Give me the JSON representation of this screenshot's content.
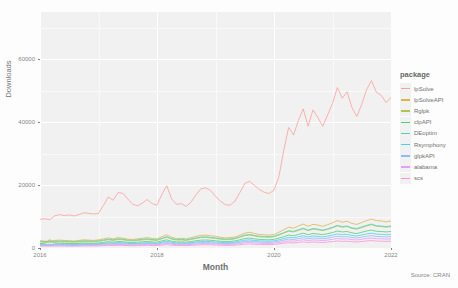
{
  "chart_data": {
    "type": "line",
    "title": "",
    "xlabel": "Month",
    "ylabel": "Downloads",
    "caption": "Source: CRAN",
    "legend_title": "package",
    "legend_position": "right",
    "grid": true,
    "xlim": [
      2016.0,
      2022.0
    ],
    "ylim": [
      0,
      75000
    ],
    "x_ticks": [
      "2016",
      "2018",
      "2020",
      "2022"
    ],
    "x_tick_values": [
      2016,
      2018,
      2020,
      2022
    ],
    "y_ticks": [
      "0",
      "20000",
      "40000",
      "60000"
    ],
    "y_tick_values": [
      0,
      20000,
      40000,
      60000
    ],
    "x_start": 2016.0,
    "x_step": 0.08333,
    "series": [
      {
        "name": "lpSolve",
        "color": "#F8766D",
        "values": [
          9100,
          9300,
          9000,
          10200,
          10600,
          10300,
          10500,
          10200,
          10600,
          11200,
          11000,
          10800,
          11000,
          13500,
          16200,
          15200,
          17600,
          17400,
          15600,
          13900,
          13400,
          14300,
          15400,
          14100,
          13600,
          17000,
          19800,
          15600,
          13900,
          14100,
          13200,
          14600,
          16900,
          18800,
          19100,
          18300,
          16400,
          14900,
          13800,
          13600,
          14900,
          17600,
          20500,
          21200,
          19900,
          18600,
          17700,
          17300,
          18400,
          22600,
          31000,
          38300,
          35900,
          40500,
          44200,
          38700,
          43900,
          41500,
          38700,
          42300,
          45900,
          51000,
          47600,
          49600,
          44600,
          41800,
          45700,
          50300,
          53200,
          49500,
          48500,
          46200,
          47900,
          50000,
          46300,
          43700,
          48200,
          49600,
          49100,
          46200,
          43200,
          43400,
          47000,
          52500,
          55900,
          63700,
          58200,
          70500,
          61800,
          61900,
          56900,
          53900,
          49100,
          53500,
          59000,
          65500
        ]
      },
      {
        "name": "lpSolveAPI",
        "color": "#D39200",
        "values": [
          2300,
          2200,
          2100,
          2400,
          2500,
          2400,
          2300,
          2200,
          2400,
          2600,
          2500,
          2400,
          2600,
          2900,
          3200,
          2900,
          3300,
          3100,
          2800,
          2700,
          2900,
          3100,
          3300,
          3000,
          2900,
          3600,
          4200,
          3400,
          3000,
          3100,
          2900,
          3300,
          3700,
          4000,
          4100,
          3900,
          3700,
          3400,
          3200,
          3300,
          3500,
          4100,
          4700,
          5000,
          4600,
          4300,
          4200,
          4100,
          4300,
          5000,
          5800,
          6600,
          6300,
          7000,
          7600,
          6900,
          7500,
          7300,
          6900,
          7400,
          8000,
          8700,
          8200,
          8500,
          7800,
          7500,
          8100,
          8700,
          9200,
          8700,
          8600,
          8300,
          8600,
          9000,
          8500,
          8200,
          8800,
          9100,
          9000,
          8700,
          8400,
          8500,
          9000,
          9700,
          10200,
          11200,
          10500,
          12100,
          11300,
          11400,
          10900,
          10500,
          10100,
          10600,
          11200,
          12000
        ]
      },
      {
        "name": "Rglpk",
        "color": "#93AA00",
        "values": [
          1900,
          1850,
          1800,
          1950,
          2000,
          1950,
          1900,
          1850,
          1950,
          2100,
          2050,
          2000,
          2100,
          2350,
          2600,
          2400,
          2700,
          2600,
          2350,
          2250,
          2400,
          2550,
          2700,
          2500,
          2400,
          2900,
          3400,
          2800,
          2500,
          2550,
          2400,
          2700,
          3000,
          3300,
          3350,
          3200,
          3000,
          2800,
          2650,
          2700,
          2900,
          3400,
          3900,
          4100,
          3800,
          3550,
          3450,
          3400,
          3550,
          4100,
          4700,
          5300,
          5100,
          5600,
          6100,
          5500,
          6000,
          5800,
          5500,
          5900,
          6400,
          7000,
          6600,
          6800,
          6200,
          6000,
          6500,
          7000,
          7400,
          6900,
          6800,
          6600,
          6800,
          7100,
          6700,
          6500,
          7000,
          7200,
          7100,
          6900,
          6600,
          6700,
          7100,
          7700,
          8100,
          8900,
          8300,
          9600,
          9000,
          9100,
          8600,
          8300,
          8000,
          8400,
          8900,
          9400
        ]
      },
      {
        "name": "clpAPI",
        "color": "#00BA38",
        "values": [
          1400,
          1500,
          2600,
          1600,
          1550,
          1500,
          1450,
          1400,
          1500,
          1600,
          1550,
          1500,
          1600,
          1800,
          2000,
          1850,
          2100,
          2000,
          1800,
          1750,
          1850,
          1950,
          2100,
          1900,
          1850,
          2250,
          2600,
          2150,
          1900,
          1950,
          1850,
          2050,
          2300,
          2500,
          2550,
          2450,
          2300,
          2150,
          2050,
          2100,
          2250,
          2600,
          3000,
          3150,
          2900,
          2750,
          2650,
          2600,
          2750,
          3150,
          3600,
          4100,
          3900,
          4300,
          4700,
          4250,
          4600,
          4450,
          4250,
          4550,
          4900,
          5400,
          5100,
          5250,
          4800,
          4600,
          5000,
          5400,
          5700,
          5300,
          5250,
          5100,
          5250,
          5500,
          5150,
          5000,
          5400,
          5550,
          5450,
          5300,
          5100,
          5150,
          5450,
          5900,
          6250,
          6850,
          6400,
          7400,
          6900,
          7000,
          6650,
          6400,
          6150,
          6450,
          6850,
          7200
        ]
      },
      {
        "name": "DEoptim",
        "color": "#00C19F",
        "values": [
          2100,
          2050,
          2000,
          2150,
          2200,
          2150,
          2100,
          2050,
          2150,
          2300,
          2250,
          2200,
          2300,
          2550,
          2800,
          2600,
          2900,
          2800,
          2550,
          2450,
          2600,
          2750,
          2900,
          2700,
          2600,
          3100,
          3600,
          3000,
          2700,
          2750,
          2600,
          2900,
          3200,
          3500,
          3550,
          3400,
          3200,
          3000,
          2850,
          2900,
          3100,
          3600,
          4100,
          4300,
          4000,
          3750,
          3650,
          3600,
          3750,
          4300,
          4900,
          5500,
          5300,
          5800,
          6300,
          5700,
          6200,
          6000,
          5700,
          6100,
          6600,
          7200,
          6800,
          7000,
          6400,
          6200,
          6700,
          7200,
          7600,
          7100,
          7000,
          6800,
          7000,
          7300,
          6900,
          6700,
          7200,
          7400,
          7300,
          7100,
          6800,
          6900,
          7300,
          7900,
          8300,
          9100,
          8500,
          9800,
          9200,
          9300,
          8800,
          8500,
          8200,
          8600,
          9100,
          9600
        ]
      },
      {
        "name": "Rsymphony",
        "color": "#00B9E3",
        "values": [
          1200,
          1180,
          1150,
          1250,
          1280,
          1250,
          1220,
          1180,
          1250,
          1320,
          1300,
          1280,
          1320,
          1480,
          1650,
          1520,
          1720,
          1650,
          1480,
          1420,
          1520,
          1600,
          1720,
          1580,
          1520,
          1850,
          2150,
          1780,
          1580,
          1620,
          1520,
          1700,
          1900,
          2080,
          2120,
          2020,
          1900,
          1780,
          1700,
          1720,
          1850,
          2150,
          2480,
          2600,
          2400,
          2280,
          2200,
          2150,
          2280,
          2600,
          3000,
          3400,
          3250,
          3580,
          3900,
          3520,
          3820,
          3700,
          3520,
          3780,
          4100,
          4480,
          4220,
          4350,
          3980,
          3820,
          4150,
          4480,
          4720,
          4400,
          4350,
          4220,
          4350,
          4550,
          4280,
          4150,
          4480,
          4600,
          4520,
          4400,
          4220,
          4280,
          4520,
          4900,
          5180,
          5680,
          5320,
          6150,
          5750,
          5820,
          5520,
          5320,
          5120,
          5350,
          5680,
          6000
        ]
      },
      {
        "name": "glpkAPI",
        "color": "#619CFF",
        "values": [
          1000,
          980,
          960,
          1030,
          1060,
          1030,
          1000,
          980,
          1030,
          1100,
          1080,
          1060,
          1100,
          1230,
          1370,
          1270,
          1430,
          1370,
          1230,
          1180,
          1270,
          1330,
          1430,
          1320,
          1270,
          1540,
          1790,
          1480,
          1320,
          1350,
          1270,
          1420,
          1580,
          1730,
          1770,
          1680,
          1580,
          1480,
          1420,
          1430,
          1540,
          1790,
          2060,
          2170,
          2000,
          1900,
          1830,
          1790,
          1900,
          2170,
          2500,
          2830,
          2700,
          2980,
          3250,
          2930,
          3180,
          3080,
          2930,
          3150,
          3420,
          3730,
          3520,
          3620,
          3320,
          3180,
          3450,
          3730,
          3930,
          3670,
          3620,
          3520,
          3620,
          3790,
          3570,
          3450,
          3730,
          3830,
          3770,
          3670,
          3520,
          3570,
          3770,
          4080,
          4320,
          4730,
          4430,
          5120,
          4790,
          4850,
          4600,
          4430,
          4270,
          4460,
          4730,
          5000
        ]
      },
      {
        "name": "alabama",
        "color": "#DB72FB",
        "values": [
          800,
          790,
          770,
          830,
          850,
          830,
          810,
          790,
          830,
          880,
          870,
          850,
          880,
          990,
          1100,
          1020,
          1150,
          1100,
          990,
          950,
          1020,
          1070,
          1150,
          1060,
          1020,
          1240,
          1440,
          1190,
          1060,
          1090,
          1020,
          1140,
          1270,
          1390,
          1420,
          1350,
          1270,
          1190,
          1140,
          1150,
          1240,
          1440,
          1660,
          1740,
          1610,
          1530,
          1470,
          1440,
          1530,
          1740,
          2010,
          2280,
          2170,
          2390,
          2610,
          2360,
          2560,
          2480,
          2360,
          2530,
          2750,
          3000,
          2830,
          2910,
          2670,
          2560,
          2780,
          3000,
          3160,
          2950,
          2910,
          2830,
          2910,
          3050,
          2870,
          2780,
          3000,
          3080,
          3030,
          2950,
          2830,
          2870,
          3030,
          3280,
          3470,
          3800,
          3560,
          4110,
          3850,
          3900,
          3700,
          3560,
          3430,
          3590,
          3800,
          4020
        ]
      },
      {
        "name": "scs",
        "color": "#FF61C3",
        "values": [
          600,
          590,
          580,
          620,
          640,
          620,
          600,
          590,
          620,
          660,
          650,
          640,
          660,
          740,
          820,
          760,
          860,
          820,
          740,
          710,
          760,
          800,
          860,
          790,
          760,
          920,
          1070,
          890,
          790,
          810,
          760,
          850,
          950,
          1040,
          1060,
          1010,
          950,
          890,
          850,
          860,
          920,
          1070,
          1230,
          1300,
          1200,
          1140,
          1100,
          1070,
          1140,
          1300,
          1500,
          1700,
          1620,
          1790,
          1950,
          1760,
          1910,
          1850,
          1760,
          1890,
          2050,
          2240,
          2110,
          2170,
          1990,
          1910,
          2070,
          2240,
          2360,
          2200,
          2170,
          2110,
          2170,
          2270,
          2140,
          2070,
          2240,
          2300,
          2260,
          2200,
          2110,
          2140,
          2260,
          2450,
          2590,
          2840,
          2660,
          3070,
          2870,
          2910,
          2760,
          2660,
          2560,
          2680,
          2840,
          3000
        ]
      }
    ]
  }
}
